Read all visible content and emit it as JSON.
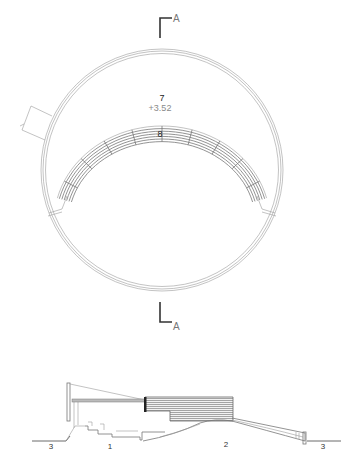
{
  "drawing": {
    "plan": {
      "space_labels": [
        {
          "id": "7",
          "text": "7",
          "elevation": "+3.52"
        },
        {
          "id": "8",
          "text": "8"
        }
      ],
      "section_marker_top": {
        "letter": "A"
      },
      "section_marker_bottom": {
        "letter": "A"
      },
      "entrance_tag": {
        "text": "1"
      }
    },
    "section": {
      "zone_labels": [
        {
          "id": "3-left",
          "text": "3"
        },
        {
          "id": "1",
          "text": "1"
        },
        {
          "id": "2",
          "text": "2"
        },
        {
          "id": "3-right",
          "text": "3"
        }
      ]
    },
    "colors": {
      "line": "#9a9a9a",
      "dark_line": "#333333",
      "hatch": "#6e6e6e",
      "background": "#ffffff"
    }
  }
}
